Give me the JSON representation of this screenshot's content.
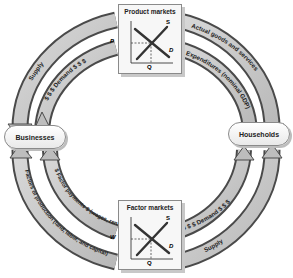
{
  "diagram": {
    "nodes": {
      "businesses": "Businesses",
      "households": "Households"
    },
    "markets": {
      "product": {
        "title": "Product markets",
        "price_label": "P",
        "quantity_label": "Q",
        "supply_label": "S",
        "demand_label": "D"
      },
      "factor": {
        "title": "Factor markets",
        "price_label": "W",
        "quantity_label": "Q",
        "supply_label": "S",
        "demand_label": "D"
      }
    },
    "flows": {
      "top_left_outer": "Supply",
      "top_left_inner": "$ $ $ Demand $ $ $",
      "top_right_outer": "Actual goods and services",
      "top_right_inner": "$ Expenditures (nominal GDP)",
      "bottom_left_inner": "$ Factor payments $ (wages, rents, interest, profits)",
      "bottom_left_outer": "Factors of production (land, labor, and capital)",
      "bottom_right_inner": "$ $ $ Demand $ $ $",
      "bottom_right_outer": "Supply"
    },
    "colors": {
      "arc_fill": "#c9c9c9",
      "arc_edge": "#4a4a4a",
      "box_border": "#8a8a8a"
    }
  }
}
